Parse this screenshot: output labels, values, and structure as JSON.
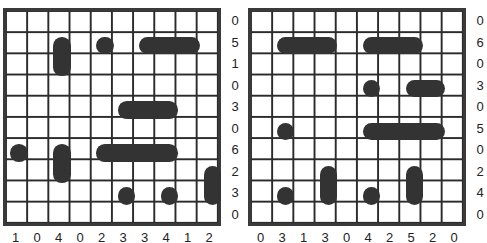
{
  "puzzles": [
    {
      "name": "left-puzzle",
      "row_clues": [
        "0",
        "5",
        "1",
        "0",
        "3",
        "0",
        "6",
        "2",
        "3",
        "0"
      ],
      "col_clues": [
        "1",
        "0",
        "4",
        "0",
        "2",
        "3",
        "3",
        "4",
        "1",
        "2"
      ],
      "ships": [
        {
          "row": 1,
          "col": 2,
          "len": 2,
          "dir": "v"
        },
        {
          "row": 1,
          "col": 4,
          "len": 1,
          "dir": "h"
        },
        {
          "row": 1,
          "col": 6,
          "len": 3,
          "dir": "h"
        },
        {
          "row": 4,
          "col": 5,
          "len": 3,
          "dir": "h"
        },
        {
          "row": 6,
          "col": 0,
          "len": 1,
          "dir": "h"
        },
        {
          "row": 6,
          "col": 2,
          "len": 2,
          "dir": "v"
        },
        {
          "row": 6,
          "col": 4,
          "len": 4,
          "dir": "h"
        },
        {
          "row": 7,
          "col": 9,
          "len": 2,
          "dir": "v"
        },
        {
          "row": 8,
          "col": 5,
          "len": 1,
          "dir": "h"
        },
        {
          "row": 8,
          "col": 7,
          "len": 1,
          "dir": "h"
        }
      ]
    },
    {
      "name": "right-puzzle",
      "row_clues": [
        "0",
        "6",
        "0",
        "3",
        "0",
        "5",
        "0",
        "2",
        "4",
        "0"
      ],
      "col_clues": [
        "0",
        "3",
        "1",
        "3",
        "0",
        "4",
        "2",
        "5",
        "2",
        "0"
      ],
      "ships": [
        {
          "row": 1,
          "col": 1,
          "len": 3,
          "dir": "h"
        },
        {
          "row": 1,
          "col": 5,
          "len": 3,
          "dir": "h"
        },
        {
          "row": 3,
          "col": 5,
          "len": 1,
          "dir": "h"
        },
        {
          "row": 3,
          "col": 7,
          "len": 2,
          "dir": "h"
        },
        {
          "row": 5,
          "col": 1,
          "len": 1,
          "dir": "h"
        },
        {
          "row": 5,
          "col": 5,
          "len": 4,
          "dir": "h"
        },
        {
          "row": 7,
          "col": 3,
          "len": 2,
          "dir": "v"
        },
        {
          "row": 7,
          "col": 7,
          "len": 2,
          "dir": "v"
        },
        {
          "row": 8,
          "col": 1,
          "len": 1,
          "dir": "h"
        },
        {
          "row": 8,
          "col": 5,
          "len": 1,
          "dir": "h"
        }
      ]
    }
  ]
}
